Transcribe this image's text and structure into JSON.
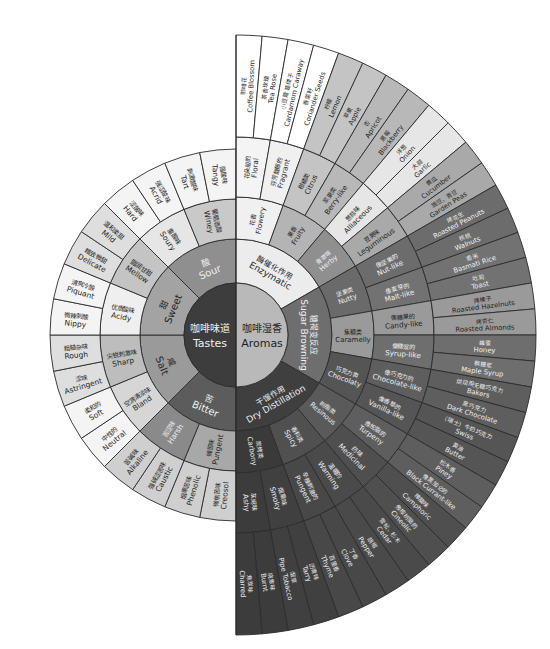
{
  "center": {
    "zh": "",
    "en": ""
  },
  "colors": {
    "tastes_core": "#3d3d3d",
    "aromas_core": "#b9b9b9",
    "stroke": "#2b2b2b",
    "dark_text": "#1f1f1f",
    "light_text": "#f0f0f0"
  },
  "tastes": {
    "label_zh": "咖啡味道",
    "label_en": "Tastes",
    "groups": [
      {
        "zh": "酸",
        "en": "Sour",
        "color": "#8f8f8f",
        "subs": [
          {
            "zh": "葡萄酒酸",
            "en": "Winey",
            "color": "#c9c9c9",
            "items": [
              {
                "zh": "刺激酸味",
                "en": "Tart"
              },
              {
                "zh": "强酸味",
                "en": "Tangy"
              }
            ]
          },
          {
            "zh": "重酸味",
            "en": "Soury",
            "color": "#e6e6e6",
            "items": [
              {
                "zh": "涩酸味",
                "en": "Hard"
              },
              {
                "zh": "强涩酸味",
                "en": "Acrid"
              }
            ]
          }
        ]
      },
      {
        "zh": "甜",
        "en": "Sweet",
        "color": "#a3a3a3",
        "subs": [
          {
            "zh": "圆润甘甜",
            "en": "Mellow",
            "color": "#c4c4c4",
            "items": [
              {
                "zh": "精致微甜",
                "en": "Delicate"
              },
              {
                "zh": "温和柔甜",
                "en": "Mild"
              }
            ]
          },
          {
            "zh": "优质酸味",
            "en": "Acidy",
            "color": "#efefef",
            "items": [
              {
                "zh": "微辣刺酸",
                "en": "Nippy"
              },
              {
                "zh": "清爽冷酸",
                "en": "Piquant"
              }
            ]
          }
        ]
      },
      {
        "zh": "咸",
        "en": "Salt",
        "color": "#9a9a9a",
        "subs": [
          {
            "zh": "尖锐刺激味",
            "en": "Sharp",
            "color": "#bdbdbd",
            "items": [
              {
                "zh": "涩味",
                "en": "Astringent"
              },
              {
                "zh": "粗糙杂味",
                "en": "Rough"
              }
            ]
          },
          {
            "zh": "空洞清淡味",
            "en": "Bland",
            "color": "#d6d6d6",
            "items": [
              {
                "zh": "中性的",
                "en": "Neutral"
              },
              {
                "zh": "柔和的",
                "en": "Soft"
              }
            ]
          }
        ]
      },
      {
        "zh": "苦",
        "en": "Bitter",
        "color": "#5c5c5c",
        "subs": [
          {
            "zh": "辣苦味",
            "en": "Pungent",
            "color": "#a8a8a8",
            "items": [
              {
                "zh": "微焦苦味",
                "en": "Creosol"
              },
              {
                "zh": "烟熏苦味",
                "en": "Phenolic"
              }
            ]
          },
          {
            "zh": "苦涩味",
            "en": "Harsh",
            "color": "#8a8a8a",
            "items": [
              {
                "zh": "强碱涩苦味",
                "en": "Caustic"
              },
              {
                "zh": "苦碱味",
                "en": "Alkaline"
              }
            ]
          }
        ]
      }
    ]
  },
  "aromas": {
    "label_zh": "咖啡湿香",
    "label_en": "Aromas",
    "groups": [
      {
        "zh": "酶催化作用",
        "en": "Enzymatic",
        "color": "#ececec",
        "subs": [
          {
            "zh": "花香",
            "en": "Flowery",
            "color": "#f2f2f2",
            "items": [
              {
                "zh": "咖啡花",
                "en": "Coffee Blossom"
              },
              {
                "zh": "茶香玫瑰",
                "en": "Tea Rose"
              }
            ]
          },
          {
            "zh": "花朵般的",
            "en": "Floral",
            "color": "#f2f2f2",
            "as_item_col": true,
            "items": []
          },
          {
            "zh": "果香",
            "en": "Fruity",
            "color": "#bcbcbc",
            "items": [
              {
                "zh": "柠檬",
                "en": "Lemon"
              },
              {
                "zh": "苹果",
                "en": "Apple"
              },
              {
                "zh": "杏",
                "en": "Apricot"
              },
              {
                "zh": "黑莓",
                "en": "Blackberry"
              }
            ]
          },
          {
            "zh": "青草味",
            "en": "Herby",
            "color": "#a7a7a7",
            "items": [
              {
                "zh": "洋葱",
                "en": "Onion"
              },
              {
                "zh": "大蒜",
                "en": "Garlic"
              },
              {
                "zh": "黄瓜",
                "en": "Cucumber"
              },
              {
                "zh": "豌豆、青豆",
                "en": "Garden Peas"
              }
            ]
          }
        ]
      },
      {
        "zh": "糖褐变反应",
        "en": "Sugar Browning",
        "color": "#6e6e6e",
        "subs": [
          {
            "zh": "坚果类",
            "en": "Nutty",
            "color": "#6a6a6a",
            "items": [
              {
                "zh": "烤花生",
                "en": "Roasted Peanuts"
              },
              {
                "zh": "核桃",
                "en": "Walnuts"
              },
              {
                "zh": "香米",
                "en": "Basmati Rice"
              },
              {
                "zh": "吐司",
                "en": "Toast"
              }
            ]
          },
          {
            "zh": "焦糖类",
            "en": "Caramelly",
            "color": "#8d8d8d",
            "items": [
              {
                "zh": "烤榛子",
                "en": "Roasted Hazelnuts"
              },
              {
                "zh": "烤杏仁",
                "en": "Roasted Almonds"
              },
              {
                "zh": "蜂蜜",
                "en": "Honey"
              },
              {
                "zh": "枫糖浆",
                "en": "Maple Syrup"
              }
            ]
          },
          {
            "zh": "巧克力类",
            "en": "Chocolaty",
            "color": "#555555",
            "items": [
              {
                "zh": "烘焙用无糖巧克力",
                "en": "Bakers"
              },
              {
                "zh": "黑巧克力",
                "en": "Dark Chocolate"
              },
              {
                "zh": "（瑞士）牛奶巧克力",
                "en": "Swiss"
              },
              {
                "zh": "黄油",
                "en": "Butter"
              }
            ]
          }
        ]
      },
      {
        "zh": "干馏作用",
        "en": "Dry Distillation",
        "color": "#3f3f3f",
        "subs": [
          {
            "zh": "树脂类",
            "en": "Resinous",
            "color": "#5a5a5a",
            "items": [
              {
                "zh": "松木香",
                "en": "Piney"
              },
              {
                "zh": "像黑加仑的",
                "en": "Black Currant-like"
              },
              {
                "zh": "樟脑味",
                "en": "Camphoric"
              },
              {
                "zh": "像桉树脑的",
                "en": "Cineolic"
              }
            ]
          },
          {
            "zh": "香料类",
            "en": "Spicy",
            "color": "#505050",
            "items": [
              {
                "zh": "雪松、杉木",
                "en": "Cedar"
              },
              {
                "zh": "胡椒",
                "en": "Pepper"
              },
              {
                "zh": "丁香",
                "en": "Clove"
              },
              {
                "zh": "百里香",
                "en": "Thyme"
              }
            ]
          },
          {
            "zh": "炭烤类",
            "en": "Carbony",
            "color": "#3a3a3a",
            "items": [
              {
                "zh": "沥青味",
                "en": "Tarry"
              },
              {
                "zh": "烟草",
                "en": "Pipe Tobacco"
              },
              {
                "zh": "烧焦味",
                "en": "Burnt"
              },
              {
                "zh": "焦炭味",
                "en": "Charred"
              }
            ]
          }
        ]
      }
    ],
    "middle_ring": [
      {
        "zh": "花朵般的",
        "en": "Floral"
      },
      {
        "zh": "芬芳馥郁的",
        "en": "Fragrant"
      },
      {
        "zh": "柑橘类",
        "en": "Citrus"
      },
      {
        "zh": "浆果类",
        "en": "Berry-like"
      },
      {
        "zh": "葱蒜味",
        "en": "Alliaceous"
      },
      {
        "zh": "豆荚味",
        "en": "Leguminous"
      },
      {
        "zh": "像坚果的",
        "en": "Nut-like"
      },
      {
        "zh": "像麦芽的",
        "en": "Malt-like"
      },
      {
        "zh": "像糖果的",
        "en": "Candy-like"
      },
      {
        "zh": "像糖浆的",
        "en": "Syrup-like"
      },
      {
        "zh": "像巧克力的",
        "en": "Chocolate-like"
      },
      {
        "zh": "像香草的",
        "en": "Vanilla-like"
      },
      {
        "zh": "像松脂的",
        "en": "Turpeny"
      },
      {
        "zh": "药味",
        "en": "Medicinal"
      },
      {
        "zh": "温暖的",
        "en": "Warming"
      },
      {
        "zh": "辛辣刺激的",
        "en": "Pungent"
      },
      {
        "zh": "烟熏味",
        "en": "Smoky"
      },
      {
        "zh": "灰烬味",
        "en": "Ashy"
      }
    ],
    "outer_ring": [
      {
        "zh": "咖啡花",
        "en": "Coffee Blossom"
      },
      {
        "zh": "茶香玫瑰",
        "en": "Tea Rose"
      },
      {
        "zh": "小豆蔻 葛缕子",
        "en": "Cardamom Caraway"
      },
      {
        "zh": "香菜籽",
        "en": "Coriander Seeds"
      },
      {
        "zh": "柠檬",
        "en": "Lemon"
      },
      {
        "zh": "苹果",
        "en": "Apple"
      },
      {
        "zh": "杏",
        "en": "Apricot"
      },
      {
        "zh": "黑莓",
        "en": "Blackberry"
      },
      {
        "zh": "洋葱",
        "en": "Onion"
      },
      {
        "zh": "大蒜",
        "en": "Garlic"
      },
      {
        "zh": "黄瓜",
        "en": "Cucumber"
      },
      {
        "zh": "豌豆、青豆",
        "en": "Garden Peas"
      },
      {
        "zh": "烤花生",
        "en": "Roasted Peanuts"
      },
      {
        "zh": "核桃",
        "en": "Walnuts"
      },
      {
        "zh": "香米",
        "en": "Basmati Rice"
      },
      {
        "zh": "吐司",
        "en": "Toast"
      },
      {
        "zh": "烤榛子",
        "en": "Roasted Hazelnuts"
      },
      {
        "zh": "烤杏仁",
        "en": "Roasted Almonds"
      },
      {
        "zh": "蜂蜜",
        "en": "Honey"
      },
      {
        "zh": "枫糖浆",
        "en": "Maple Syrup"
      },
      {
        "zh": "烘焙用无糖巧克力",
        "en": "Bakers"
      },
      {
        "zh": "黑巧克力",
        "en": "Dark Chocolate"
      },
      {
        "zh": "（瑞士）牛奶巧克力",
        "en": "Swiss"
      },
      {
        "zh": "黄油",
        "en": "Butter"
      },
      {
        "zh": "松木香",
        "en": "Piney"
      },
      {
        "zh": "像黑加仑的",
        "en": "Black Currant-like"
      },
      {
        "zh": "樟脑味",
        "en": "Camphoric"
      },
      {
        "zh": "像桉树脑的",
        "en": "Cineolic"
      },
      {
        "zh": "雪松、杉木",
        "en": "Cedar"
      },
      {
        "zh": "胡椒",
        "en": "Pepper"
      },
      {
        "zh": "丁香",
        "en": "Clove"
      },
      {
        "zh": "百里香",
        "en": "Thyme"
      },
      {
        "zh": "沥青味",
        "en": "Tarry"
      },
      {
        "zh": "烟草",
        "en": "Pipe Tobacco"
      },
      {
        "zh": "烧焦味",
        "en": "Burnt"
      },
      {
        "zh": "焦炭味",
        "en": "Charred"
      }
    ],
    "inner_sub_ring": [
      {
        "zh": "花香",
        "en": "Flowery"
      },
      {
        "zh": "果香",
        "en": "Fruity"
      },
      {
        "zh": "青草味",
        "en": "Herby"
      },
      {
        "zh": "坚果类",
        "en": "Nutty"
      },
      {
        "zh": "焦糖类",
        "en": "Caramelly"
      },
      {
        "zh": "巧克力类",
        "en": "Chocolaty"
      },
      {
        "zh": "树脂类",
        "en": "Resinous"
      },
      {
        "zh": "香料类",
        "en": "Spicy"
      },
      {
        "zh": "炭烤类",
        "en": "Carbony"
      }
    ]
  }
}
